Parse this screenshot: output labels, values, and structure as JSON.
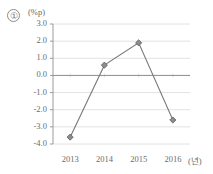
{
  "figure": {
    "index_label": "①",
    "y_unit_label": "(%p)",
    "x_unit_label": "(년)"
  },
  "style": {
    "line_color": "#7a7a7a",
    "marker_color": "#8c8c8c",
    "marker_edge_color": "#5f5f5f",
    "grid_color": "#e2e2e2",
    "axis_color": "#9a9a9a",
    "zero_line_color": "#8f8f8f",
    "text_color": "#6b6b6b"
  },
  "chart_data": {
    "type": "line",
    "title": "",
    "subtitle": "",
    "xlabel": "(년)",
    "ylabel": "(%p)",
    "categories": [
      "2013",
      "2014",
      "2015",
      "2016"
    ],
    "values": [
      -3.6,
      0.6,
      1.9,
      -2.6
    ],
    "series": [
      {
        "name": "",
        "values": [
          -3.6,
          0.6,
          1.9,
          -2.6
        ]
      }
    ],
    "ylim": [
      -4.0,
      3.0
    ],
    "yticks": [
      3.0,
      2.0,
      1.0,
      0.0,
      -1.0,
      -2.0,
      -3.0,
      -4.0
    ],
    "ytick_labels": [
      "3.0",
      "2.0",
      "1.0",
      "0.0",
      "-1.0",
      "-2.0",
      "-3.0",
      "-4.0"
    ],
    "xtick_labels": [
      "2013",
      "2014",
      "2015",
      "2016"
    ],
    "grid": true,
    "grid_axis": "y",
    "legend": false,
    "legend_position": "none",
    "markers": "diamond",
    "annotations": [
      "①"
    ]
  }
}
